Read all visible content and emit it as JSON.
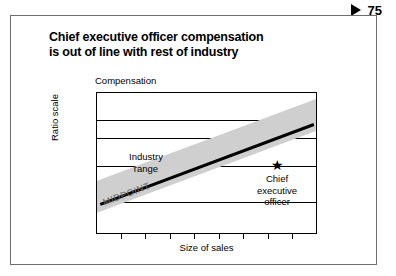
{
  "page_marker": {
    "icon": "triangle-right-icon",
    "number": "75"
  },
  "exhibit": {
    "title_line_1": "Chief executive officer compensation",
    "title_line_2": "is out of line with rest of industry"
  },
  "chart_data": {
    "type": "scatter",
    "title": "Chief executive officer compensation is out of line with rest of industry",
    "xlabel": "Size of sales",
    "ylabel": "Compensation",
    "y_scale_note": "Ratio scale",
    "grid": true,
    "gridlines_y_fraction": [
      0.19,
      0.32,
      0.52,
      0.78
    ],
    "x_tick_count": 8,
    "annotations": [
      {
        "name": "industry-range",
        "text": "Industry range",
        "lines": [
          "Industry",
          "range"
        ]
      },
      {
        "name": "midpoint",
        "text": "MIDPOINT"
      },
      {
        "name": "chief-executive-officer",
        "text": "Chief executive officer",
        "lines": [
          "Chief",
          "executive",
          "officer"
        ],
        "marker": "star"
      }
    ],
    "series": [
      {
        "name": "Industry range band",
        "type": "band",
        "color": "#cfcfcf",
        "x": [
          0,
          1
        ],
        "y_low": [
          0.08,
          0.68
        ],
        "y_high": [
          0.26,
          0.86
        ]
      },
      {
        "name": "MIDPOINT",
        "type": "line",
        "color": "#000000",
        "x": [
          0.05,
          0.98
        ],
        "y": [
          0.12,
          0.8
        ]
      },
      {
        "name": "Chief executive officer",
        "type": "point",
        "marker": "star",
        "color": "#000000",
        "x": [
          0.81
        ],
        "y": [
          0.47
        ]
      }
    ]
  },
  "colors": {
    "band": "#cfcfcf",
    "line": "#000000",
    "frame": "#6e6e6e",
    "text": "#000000",
    "midpoint_text": "#6b6b6b"
  }
}
